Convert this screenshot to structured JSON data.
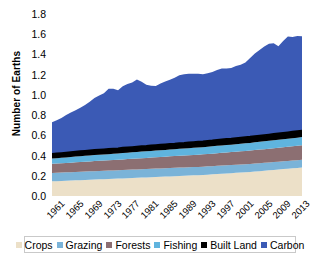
{
  "chart_data": {
    "type": "area",
    "title": "",
    "xlabel": "",
    "ylabel": "Number of Earths",
    "ylim": [
      0,
      1.8
    ],
    "yticks": [
      "0.0",
      "0.2",
      "0.4",
      "0.6",
      "0.8",
      "1.0",
      "1.2",
      "1.4",
      "1.6",
      "1.8"
    ],
    "ytick_values": [
      0.0,
      0.2,
      0.4,
      0.6,
      0.8,
      1.0,
      1.2,
      1.4,
      1.6,
      1.8
    ],
    "grid": false,
    "legend_position": "bottom",
    "stacked": true,
    "xlim": [
      1961,
      2014
    ],
    "xtick_labels": [
      "1961",
      "1965",
      "1969",
      "1973",
      "1977",
      "1981",
      "1985",
      "1989",
      "1993",
      "1997",
      "2001",
      "2005",
      "2009",
      "2013"
    ],
    "xtick_values": [
      1961,
      1965,
      1969,
      1973,
      1977,
      1981,
      1985,
      1989,
      1993,
      1997,
      2001,
      2005,
      2009,
      2013
    ],
    "x": [
      1961,
      1962,
      1963,
      1964,
      1965,
      1966,
      1967,
      1968,
      1969,
      1970,
      1971,
      1972,
      1973,
      1974,
      1975,
      1976,
      1977,
      1978,
      1979,
      1980,
      1981,
      1982,
      1983,
      1984,
      1985,
      1986,
      1987,
      1988,
      1989,
      1990,
      1991,
      1992,
      1993,
      1994,
      1995,
      1996,
      1997,
      1998,
      1999,
      2000,
      2001,
      2002,
      2003,
      2004,
      2005,
      2006,
      2007,
      2008,
      2009,
      2010,
      2011,
      2012,
      2013,
      2014
    ],
    "series": [
      {
        "name": "Crops",
        "color": "#ece0c8",
        "values": [
          0.145,
          0.147,
          0.149,
          0.151,
          0.153,
          0.155,
          0.157,
          0.159,
          0.161,
          0.163,
          0.165,
          0.166,
          0.168,
          0.17,
          0.172,
          0.174,
          0.176,
          0.178,
          0.18,
          0.182,
          0.184,
          0.186,
          0.188,
          0.19,
          0.192,
          0.194,
          0.196,
          0.198,
          0.2,
          0.202,
          0.204,
          0.206,
          0.208,
          0.211,
          0.214,
          0.217,
          0.22,
          0.223,
          0.226,
          0.229,
          0.232,
          0.235,
          0.238,
          0.242,
          0.246,
          0.25,
          0.254,
          0.258,
          0.262,
          0.266,
          0.27,
          0.274,
          0.278,
          0.282
        ]
      },
      {
        "name": "Grazing",
        "color": "#7ab3d8",
        "values": [
          0.083,
          0.083,
          0.083,
          0.083,
          0.083,
          0.083,
          0.083,
          0.083,
          0.083,
          0.083,
          0.083,
          0.083,
          0.083,
          0.083,
          0.083,
          0.083,
          0.083,
          0.083,
          0.083,
          0.083,
          0.083,
          0.083,
          0.083,
          0.083,
          0.083,
          0.083,
          0.083,
          0.083,
          0.082,
          0.082,
          0.082,
          0.082,
          0.082,
          0.082,
          0.081,
          0.081,
          0.081,
          0.081,
          0.08,
          0.08,
          0.08,
          0.08,
          0.079,
          0.079,
          0.079,
          0.078,
          0.078,
          0.078,
          0.077,
          0.077,
          0.077,
          0.076,
          0.076,
          0.076
        ]
      },
      {
        "name": "Forests",
        "color": "#8c6f72",
        "values": [
          0.09,
          0.091,
          0.092,
          0.093,
          0.094,
          0.095,
          0.096,
          0.097,
          0.098,
          0.099,
          0.1,
          0.101,
          0.102,
          0.103,
          0.104,
          0.105,
          0.106,
          0.107,
          0.108,
          0.109,
          0.11,
          0.111,
          0.112,
          0.113,
          0.114,
          0.115,
          0.116,
          0.117,
          0.118,
          0.119,
          0.12,
          0.121,
          0.122,
          0.123,
          0.124,
          0.125,
          0.126,
          0.127,
          0.128,
          0.129,
          0.13,
          0.131,
          0.132,
          0.133,
          0.134,
          0.135,
          0.136,
          0.137,
          0.138,
          0.139,
          0.14,
          0.141,
          0.142,
          0.143
        ]
      },
      {
        "name": "Fishing",
        "color": "#5fb4de",
        "values": [
          0.052,
          0.053,
          0.054,
          0.055,
          0.056,
          0.057,
          0.058,
          0.058,
          0.059,
          0.06,
          0.06,
          0.061,
          0.061,
          0.062,
          0.062,
          0.063,
          0.063,
          0.064,
          0.064,
          0.065,
          0.065,
          0.066,
          0.066,
          0.067,
          0.067,
          0.068,
          0.068,
          0.069,
          0.069,
          0.07,
          0.07,
          0.071,
          0.071,
          0.072,
          0.072,
          0.073,
          0.073,
          0.074,
          0.074,
          0.075,
          0.075,
          0.076,
          0.076,
          0.077,
          0.077,
          0.078,
          0.078,
          0.079,
          0.079,
          0.08,
          0.08,
          0.081,
          0.081,
          0.082
        ]
      },
      {
        "name": "Built Land",
        "color": "#000000",
        "values": [
          0.046,
          0.046,
          0.046,
          0.047,
          0.047,
          0.047,
          0.048,
          0.048,
          0.048,
          0.049,
          0.049,
          0.049,
          0.05,
          0.05,
          0.05,
          0.051,
          0.051,
          0.051,
          0.052,
          0.052,
          0.052,
          0.053,
          0.053,
          0.053,
          0.054,
          0.054,
          0.054,
          0.055,
          0.055,
          0.055,
          0.056,
          0.056,
          0.056,
          0.057,
          0.057,
          0.057,
          0.058,
          0.058,
          0.058,
          0.059,
          0.059,
          0.059,
          0.06,
          0.06,
          0.06,
          0.061,
          0.061,
          0.061,
          0.062,
          0.062,
          0.062,
          0.063,
          0.063,
          0.063
        ]
      },
      {
        "name": "Carbon",
        "color": "#3b5ab5",
        "values": [
          0.314,
          0.33,
          0.348,
          0.372,
          0.392,
          0.412,
          0.43,
          0.456,
          0.482,
          0.516,
          0.536,
          0.556,
          0.596,
          0.592,
          0.576,
          0.61,
          0.628,
          0.64,
          0.664,
          0.64,
          0.606,
          0.592,
          0.586,
          0.607,
          0.622,
          0.636,
          0.652,
          0.672,
          0.68,
          0.682,
          0.676,
          0.672,
          0.666,
          0.668,
          0.678,
          0.694,
          0.702,
          0.698,
          0.7,
          0.714,
          0.722,
          0.74,
          0.78,
          0.818,
          0.848,
          0.876,
          0.9,
          0.898,
          0.862,
          0.91,
          0.948,
          0.938,
          0.942,
          0.934
        ]
      }
    ],
    "totals_note": "Total ecological footprint rises from about 0.73 Earths in 1961 to about 1.68 Earths by 2014"
  },
  "legend": {
    "items": [
      {
        "label": "Crops",
        "color": "#ece0c8"
      },
      {
        "label": "Grazing",
        "color": "#7ab3d8"
      },
      {
        "label": "Forests",
        "color": "#8c6f72"
      },
      {
        "label": "Fishing",
        "color": "#5fb4de"
      },
      {
        "label": "Built Land",
        "color": "#000000"
      },
      {
        "label": "Carbon",
        "color": "#3b5ab5"
      }
    ]
  }
}
